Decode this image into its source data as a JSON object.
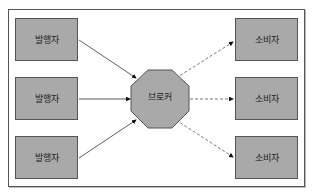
{
  "diagram": {
    "publishers": [
      {
        "label": "발행자"
      },
      {
        "label": "발행자"
      },
      {
        "label": "발행자"
      }
    ],
    "broker": {
      "label": "브로커",
      "shape": "octagon"
    },
    "consumers": [
      {
        "label": "소비자"
      },
      {
        "label": "소비자"
      },
      {
        "label": "소비자"
      }
    ],
    "edges": [
      {
        "from": "publisher-1",
        "to": "broker",
        "style": "solid"
      },
      {
        "from": "publisher-2",
        "to": "broker",
        "style": "solid"
      },
      {
        "from": "publisher-3",
        "to": "broker",
        "style": "solid"
      },
      {
        "from": "broker",
        "to": "consumer-1",
        "style": "dashed"
      },
      {
        "from": "broker",
        "to": "consumer-2",
        "style": "dashed"
      },
      {
        "from": "broker",
        "to": "consumer-3",
        "style": "dashed"
      }
    ],
    "colors": {
      "node_fill": "#a9a9a9",
      "stroke": "#555555",
      "background": "#ffffff"
    }
  }
}
